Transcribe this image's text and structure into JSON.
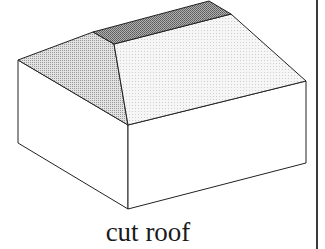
{
  "figure": {
    "caption": "cut roof",
    "colors": {
      "ridge_band": "#8c8c8c",
      "hip_face": "#c6c6c6",
      "main_roof_face": "#ececec",
      "walls": "#ffffff",
      "stroke": "#222222",
      "rule": "#3a3a3a"
    },
    "vertices": {
      "ridge_back_left": [
        93,
        32
      ],
      "ridge_back_right": [
        209,
        1
      ],
      "ridge_front_left": [
        114,
        44
      ],
      "ridge_front_right": [
        231,
        14
      ],
      "eave_left": [
        18,
        60
      ],
      "eave_front": [
        128,
        125
      ],
      "eave_right": [
        306,
        81
      ],
      "base_left": [
        18,
        143
      ],
      "base_front": [
        128,
        209
      ],
      "base_right": [
        306,
        163
      ]
    }
  }
}
